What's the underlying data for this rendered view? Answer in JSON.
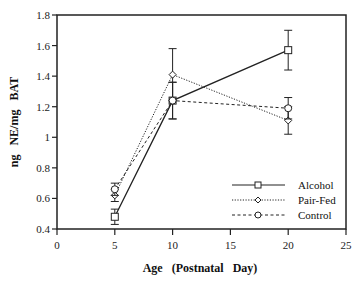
{
  "chart_data": {
    "type": "line",
    "title": "",
    "xlabel": "Age   (Postnatal   Day)",
    "ylabel": "ng   NE/mg   BAT",
    "xlim": [
      0,
      25
    ],
    "ylim": [
      0.4,
      1.8
    ],
    "xticks": [
      0,
      5,
      10,
      15,
      20,
      25
    ],
    "yticks": [
      0.4,
      0.6,
      0.8,
      1,
      1.2,
      1.4,
      1.6,
      1.8
    ],
    "ytick_labels": [
      "0.4",
      "0.6",
      "0.8",
      "1",
      "1.2",
      "1.4",
      "1.6",
      "1.8"
    ],
    "grid": false,
    "legend_position": "lower right",
    "x": [
      5,
      10,
      20
    ],
    "series": [
      {
        "name": "Alcohol",
        "marker": "square",
        "line": "solid",
        "values": [
          0.48,
          1.24,
          1.57
        ],
        "error": [
          0.05,
          0.12,
          0.13
        ]
      },
      {
        "name": "Pair-Fed",
        "marker": "diamond",
        "line": "dotted",
        "values": [
          0.62,
          1.41,
          1.11
        ],
        "error": [
          0.04,
          0.17,
          0.09
        ]
      },
      {
        "name": "Control",
        "marker": "circle",
        "line": "dashed",
        "values": [
          0.66,
          1.24,
          1.19
        ],
        "error": [
          0.04,
          0.12,
          0.07
        ]
      }
    ]
  }
}
